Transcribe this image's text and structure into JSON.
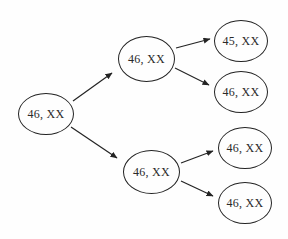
{
  "diagram": {
    "type": "tree",
    "nodes": {
      "root": {
        "label": "46, XX"
      },
      "branch_top": {
        "label": "46, XX"
      },
      "branch_bottom": {
        "label": "46, XX"
      },
      "leaf_top_1": {
        "label": "45, XX"
      },
      "leaf_top_2": {
        "label": "46, XX"
      },
      "leaf_bottom_1": {
        "label": "46, XX"
      },
      "leaf_bottom_2": {
        "label": "46, XX"
      }
    },
    "edges": [
      {
        "from": "root",
        "to": "branch_top"
      },
      {
        "from": "root",
        "to": "branch_bottom"
      },
      {
        "from": "branch_top",
        "to": "leaf_top_1"
      },
      {
        "from": "branch_top",
        "to": "leaf_top_2"
      },
      {
        "from": "branch_bottom",
        "to": "leaf_bottom_1"
      },
      {
        "from": "branch_bottom",
        "to": "leaf_bottom_2"
      }
    ],
    "colors": {
      "stroke": "#232323",
      "background": "#fefefe",
      "text": "#2a2a2a"
    }
  }
}
